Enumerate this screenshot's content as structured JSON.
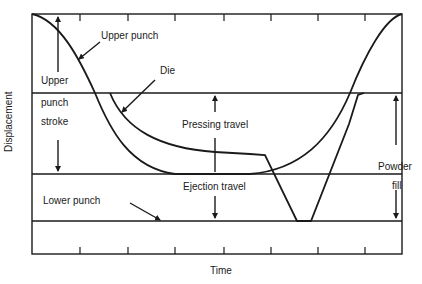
{
  "diagram": {
    "axes": {
      "xlabel": "Time",
      "ylabel": "Displacement"
    },
    "labels": {
      "upper_punch": "Upper punch",
      "die": "Die",
      "upper": "Upper",
      "punch": "punch",
      "stroke": "stroke",
      "pressing_travel": "Pressing travel",
      "ejection_travel": "Ejection travel",
      "lower_punch": "Lower punch",
      "powder": "Powder",
      "fill": "fill"
    },
    "colors": {
      "line": "#1a1a1a",
      "background": "#ffffff"
    },
    "ticks": {
      "top_x": [
        80,
        128,
        175,
        224,
        271,
        318,
        365
      ],
      "bottom_x": [
        80,
        128,
        175,
        224,
        271,
        318,
        365
      ]
    }
  }
}
